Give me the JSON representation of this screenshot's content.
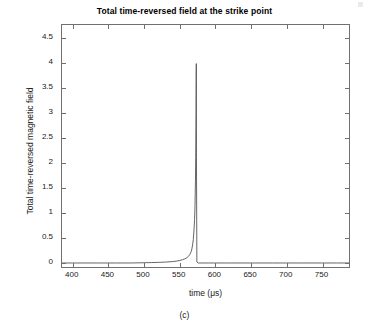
{
  "figure": {
    "caption": "(c)",
    "background_color": "#ffffff",
    "frame_color": "#707070"
  },
  "chart_data": {
    "type": "line",
    "title": "Total time-reversed field at the strike point",
    "xlabel": "time (μs)",
    "ylabel": "Total time-reversed magnetic field",
    "xlim": [
      385,
      790
    ],
    "ylim": [
      -0.12,
      4.75
    ],
    "xticks": [
      400,
      450,
      500,
      550,
      600,
      650,
      700,
      750
    ],
    "xticklabels": [
      "400",
      "450",
      "500",
      "550",
      "600",
      "650",
      "700",
      "750"
    ],
    "yticks": [
      0,
      0.5,
      1,
      1.5,
      2,
      2.5,
      3,
      3.5,
      4,
      4.5
    ],
    "yticklabels": [
      "0",
      "0.5",
      "1",
      "1.5",
      "2",
      "2.5",
      "3",
      "3.5",
      "4",
      "4.5"
    ],
    "grid": false,
    "legend": null,
    "line_color": "#555555",
    "line_width": 0.9,
    "peak": {
      "x": 573,
      "y": 3.98
    },
    "series": [
      {
        "name": "Total time-reversed magnetic field",
        "x": [
          385,
          400,
          420,
          440,
          460,
          480,
          500,
          510,
          520,
          530,
          540,
          545,
          550,
          554,
          557,
          560,
          562,
          564,
          566,
          567,
          568,
          569,
          570,
          570.8,
          571.4,
          572,
          572.4,
          572.8,
          573,
          573.1,
          573.2,
          573.4,
          574,
          576,
          580,
          590,
          600,
          620,
          650,
          680,
          700,
          720,
          750,
          770,
          790
        ],
        "y": [
          0.0,
          0.0,
          0.0,
          0.0,
          0.0,
          0.0,
          0.005,
          0.008,
          0.012,
          0.018,
          0.028,
          0.036,
          0.05,
          0.066,
          0.082,
          0.105,
          0.13,
          0.165,
          0.225,
          0.28,
          0.36,
          0.47,
          0.66,
          0.87,
          1.15,
          1.62,
          2.1,
          3.0,
          3.62,
          3.9,
          3.98,
          2.2,
          0.02,
          0.0,
          0.0,
          0.0,
          0.0,
          0.0,
          0.0,
          0.0,
          0.0,
          0.0,
          0.0,
          0.0,
          0.0
        ]
      }
    ]
  }
}
